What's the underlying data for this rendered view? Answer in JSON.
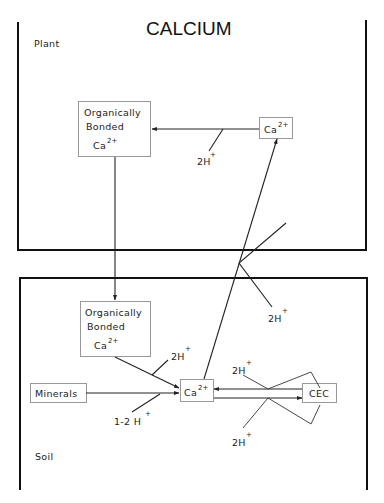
{
  "diagram": {
    "title": "CALCIUM",
    "regions": {
      "plant": {
        "label": "Plant"
      },
      "soil": {
        "label": "Soil"
      }
    },
    "nodes": {
      "plant_organic": {
        "line1": "Organically",
        "line2": "Bonded",
        "ion": "Ca",
        "charge": "2+"
      },
      "plant_ca": {
        "ion": "Ca",
        "charge": "2+"
      },
      "soil_organic": {
        "line1": "Organically",
        "line2": "Bonded",
        "ion": "Ca",
        "charge": "2+"
      },
      "soil_ca": {
        "ion": "Ca",
        "charge": "2+"
      },
      "minerals": {
        "label": "Minerals"
      },
      "cec": {
        "label": "CEC"
      }
    },
    "reactants": {
      "plant_uptake_h": {
        "text": "2H",
        "charge": "+"
      },
      "root_exchange_h": {
        "text": "2H",
        "charge": "+"
      },
      "soil_organic_h": {
        "text": "2H",
        "charge": "+"
      },
      "minerals_h": {
        "text": "1-2 H",
        "charge": "+"
      },
      "cec_upper_h": {
        "text": "2H",
        "charge": "+"
      },
      "cec_lower_h": {
        "text": "2H",
        "charge": "+"
      }
    },
    "edges": [
      {
        "from": "Ca2+ (plant)",
        "to": "Organically Bonded Ca2+ (plant)",
        "with": "2H+"
      },
      {
        "from": "Organically Bonded Ca2+ (plant)",
        "to": "Organically Bonded Ca2+ (soil)"
      },
      {
        "from": "Organically Bonded Ca2+ (soil)",
        "to": "Ca2+ (soil)",
        "with": "2H+"
      },
      {
        "from": "Minerals",
        "to": "Ca2+ (soil)",
        "with": "1-2 H+"
      },
      {
        "from": "Ca2+ (soil)",
        "to": "Ca2+ (plant)",
        "with": "2H+"
      },
      {
        "from": "CEC",
        "to": "Ca2+ (soil)",
        "with": "2H+"
      },
      {
        "from": "Ca2+ (soil)",
        "to": "CEC",
        "with": "2H+"
      }
    ]
  }
}
